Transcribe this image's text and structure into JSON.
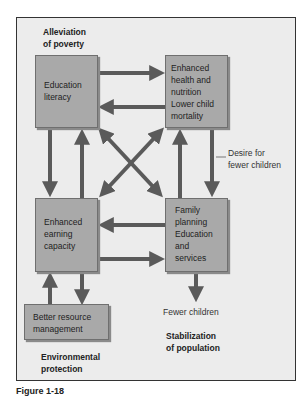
{
  "diagram": {
    "headings": {
      "poverty": [
        "Alleviation",
        "of poverty"
      ],
      "population": [
        "Stabilization",
        "of population"
      ],
      "environment": [
        "Environmental",
        "protection"
      ]
    },
    "boxes": {
      "education": [
        "Education",
        "literacy"
      ],
      "health": [
        "Enhanced",
        "health and",
        "nutrition",
        "Lower child",
        "mortality"
      ],
      "earning": [
        "Enhanced",
        "earning",
        "capacity"
      ],
      "family": [
        "Family",
        "planning",
        "Education",
        "and",
        "services"
      ],
      "resource": [
        "Better resource",
        "management"
      ]
    },
    "labels": {
      "desire": [
        "Desire for",
        "fewer children"
      ],
      "fewer": "Fewer children"
    },
    "colors": {
      "box_fill": "#a9a9a9",
      "arrow": "#5a5a5a",
      "background": "#ececec"
    },
    "caption": "Figure 1-18"
  }
}
